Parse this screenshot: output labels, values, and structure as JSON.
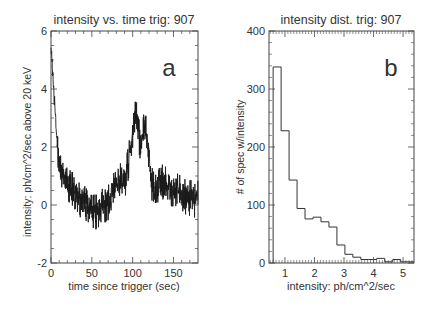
{
  "chart_data": [
    {
      "type": "line",
      "panel_label": "a",
      "title": "intensity vs. time trig: 907",
      "xlabel": "time since trigger (sec)",
      "ylabel": "intensity: ph/cm^2/sec above 20 keV",
      "xlim": [
        0,
        180
      ],
      "ylim": [
        -2,
        6
      ],
      "xticks": [
        0,
        50,
        100,
        150
      ],
      "yticks": [
        -2,
        0,
        2,
        4,
        6
      ],
      "grid": false,
      "legend": null,
      "series": [
        {
          "name": "intensity",
          "x": [
            0,
            2,
            5,
            8,
            12,
            18,
            25,
            35,
            45,
            55,
            65,
            72,
            78,
            85,
            92,
            97,
            101,
            104,
            107,
            110,
            113,
            116,
            119,
            122,
            126,
            130,
            135,
            140,
            150,
            160,
            170,
            180
          ],
          "values": [
            5.5,
            4.6,
            3.2,
            2.0,
            1.2,
            0.8,
            0.5,
            0.2,
            0.0,
            -0.1,
            0.0,
            0.1,
            0.7,
            0.8,
            1.0,
            1.8,
            2.7,
            3.3,
            2.6,
            1.8,
            2.4,
            2.8,
            2.0,
            1.0,
            0.4,
            0.7,
            0.9,
            0.7,
            0.5,
            0.3,
            0.2,
            0.2
          ],
          "noise_amplitude": 0.45
        }
      ]
    },
    {
      "type": "bar",
      "panel_label": "b",
      "title": "intensity dist. trig: 907",
      "xlabel": "intensity: ph/cm^2/sec",
      "ylabel": "# of spec w/intensity",
      "xlim": [
        0.46,
        5.37
      ],
      "ylim": [
        0,
        400
      ],
      "xticks": [
        1,
        2,
        3,
        4,
        5
      ],
      "yticks": [
        0,
        100,
        200,
        300,
        400
      ],
      "grid": false,
      "legend": null,
      "histogram": true,
      "bin_width": 0.27,
      "bin_starts": [
        0.6,
        0.87,
        1.14,
        1.41,
        1.68,
        1.95,
        2.22,
        2.49,
        2.76,
        3.03,
        3.3,
        3.57,
        3.84,
        4.11,
        4.38,
        4.65,
        4.92,
        5.19
      ],
      "values": [
        338,
        228,
        143,
        94,
        76,
        79,
        71,
        62,
        31,
        15,
        10,
        6,
        6,
        8,
        2,
        6,
        2,
        2
      ]
    }
  ]
}
